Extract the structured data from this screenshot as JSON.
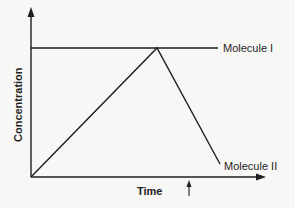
{
  "diagram": {
    "y_axis_label": "Concentration",
    "x_axis_label": "Time",
    "series": [
      {
        "name": "Molecule I",
        "label": "Molecule I",
        "description": "constant horizontal line at high concentration"
      },
      {
        "name": "Molecule II",
        "label": "Molecule II",
        "description": "rises linearly from origin to peak at Molecule I level, then falls steeply"
      }
    ],
    "marker": {
      "description": "small upward arrow below time axis indicating a point in time"
    },
    "colors": {
      "line": "#1e1e1e",
      "background": "#f7f7f5"
    }
  }
}
